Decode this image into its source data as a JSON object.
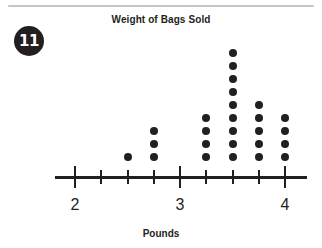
{
  "page": {
    "question_number": "11",
    "divider": true,
    "background_color": "#ffffff",
    "ink_color": "#231f20",
    "rule_color": "#c3c5c7"
  },
  "chart_data": {
    "type": "scatter",
    "plot_style": "dot-plot",
    "title": "Weight of Bags Sold",
    "subtitle": "",
    "xlabel": "Pounds",
    "ylabel": "",
    "xlim": [
      2,
      4
    ],
    "grid": false,
    "legend": null,
    "x_tick_labels": [
      "2",
      "3",
      "4"
    ],
    "x_major_ticks": [
      2,
      3,
      4
    ],
    "x_minor_ticks": [
      2.25,
      2.5,
      2.75,
      3.25,
      3.5,
      3.75
    ],
    "x_tick_interval": 0.25,
    "categories": [
      2,
      2.25,
      2.5,
      2.75,
      3,
      3.25,
      3.5,
      3.75,
      4
    ],
    "values": [
      0,
      0,
      1,
      3,
      0,
      4,
      9,
      5,
      4
    ],
    "total_count": 26,
    "points": [
      {
        "x": 2.5,
        "count": 1
      },
      {
        "x": 2.75,
        "count": 3
      },
      {
        "x": 3.25,
        "count": 4
      },
      {
        "x": 3.5,
        "count": 9
      },
      {
        "x": 3.75,
        "count": 5
      },
      {
        "x": 4,
        "count": 4
      }
    ],
    "dot_color": "#231f20"
  }
}
